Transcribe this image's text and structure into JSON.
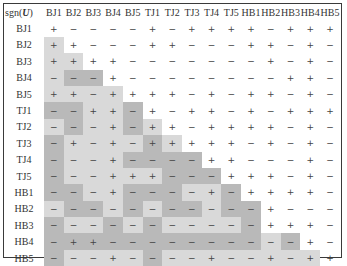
{
  "table": {
    "corner_label_prefix": "sgn(",
    "corner_label_var": "U",
    "corner_label_suffix": ")",
    "columns": [
      "BJ1",
      "BJ2",
      "BJ3",
      "BJ4",
      "BJ5",
      "TJ1",
      "TJ2",
      "TJ3",
      "TJ4",
      "TJ5",
      "HB1",
      "HB2",
      "HB3",
      "HB4",
      "HB5"
    ],
    "rows": [
      {
        "label": "BJ1",
        "cells": [
          "+",
          "−",
          "−",
          "−",
          "−",
          "+",
          "−",
          "+",
          "+",
          "+",
          "+",
          "−",
          "+",
          "+",
          "+"
        ]
      },
      {
        "label": "BJ2",
        "cells": [
          "+",
          "+",
          "−",
          "−",
          "−",
          "+",
          "+",
          "−",
          "−",
          "−",
          "+",
          "+",
          "−",
          "+",
          "−"
        ]
      },
      {
        "label": "BJ3",
        "cells": [
          "+",
          "+",
          "+",
          "+",
          "−",
          "−",
          "−",
          "−",
          "−",
          "−",
          "−",
          "+",
          "−",
          "+",
          "−"
        ]
      },
      {
        "label": "BJ4",
        "cells": [
          "−",
          "−",
          "−",
          "+",
          "−",
          "−",
          "−",
          "−",
          "−",
          "−",
          "−",
          "−",
          "+",
          "+",
          "−"
        ]
      },
      {
        "label": "BJ5",
        "cells": [
          "+",
          "+",
          "−",
          "+",
          "+",
          "+",
          "+",
          "−",
          "+",
          "−",
          "+",
          "+",
          "−",
          "+",
          "−"
        ]
      },
      {
        "label": "TJ1",
        "cells": [
          "−",
          "−",
          "+",
          "+",
          "−",
          "+",
          "−",
          "+",
          "+",
          "−",
          "+",
          "−",
          "+",
          "+",
          "+"
        ]
      },
      {
        "label": "TJ2",
        "cells": [
          "−",
          "−",
          "−",
          "+",
          "−",
          "+",
          "+",
          "−",
          "+",
          "+",
          "+",
          "+",
          "−",
          "+",
          "−"
        ]
      },
      {
        "label": "TJ3",
        "cells": [
          "−",
          "+",
          "−",
          "+",
          "−",
          "+",
          "+",
          "+",
          "+",
          "+",
          "−",
          "+",
          "−",
          "+",
          "−"
        ]
      },
      {
        "label": "TJ4",
        "cells": [
          "−",
          "−",
          "−",
          "+",
          "−",
          "−",
          "−",
          "−",
          "+",
          "+",
          "−",
          "−",
          "−",
          "+",
          "−"
        ]
      },
      {
        "label": "TJ5",
        "cells": [
          "−",
          "−",
          "−",
          "+",
          "+",
          "+",
          "−",
          "−",
          "−",
          "+",
          "+",
          "+",
          "−",
          "+",
          "−"
        ]
      },
      {
        "label": "HB1",
        "cells": [
          "−",
          "−",
          "−",
          "+",
          "−",
          "−",
          "−",
          "−",
          "+",
          "−",
          "+",
          "+",
          "+",
          "+",
          "−"
        ]
      },
      {
        "label": "HB2",
        "cells": [
          "−",
          "−",
          "−",
          "−",
          "−",
          "−",
          "−",
          "−",
          "−",
          "−",
          "−",
          "+",
          "−",
          "−",
          "−"
        ]
      },
      {
        "label": "HB3",
        "cells": [
          "−",
          "−",
          "−",
          "−",
          "−",
          "−",
          "−",
          "−",
          "−",
          "−",
          "−",
          "+",
          "+",
          "+",
          "−"
        ]
      },
      {
        "label": "HB4",
        "cells": [
          "−",
          "+",
          "+",
          "−",
          "−",
          "−",
          "−",
          "−",
          "−",
          "−",
          "−",
          "−",
          "−",
          "+",
          "−"
        ]
      },
      {
        "label": "HB5",
        "cells": [
          "−",
          "−",
          "−",
          "+",
          "−",
          "−",
          "−",
          "−",
          "+",
          "−",
          "−",
          "+",
          "−",
          "+",
          "+"
        ]
      }
    ],
    "shading": [
      [
        0,
        0,
        0,
        0,
        0,
        0,
        0,
        0,
        0,
        0,
        0,
        0,
        0,
        0,
        0
      ],
      [
        1,
        0,
        0,
        0,
        0,
        0,
        0,
        0,
        0,
        0,
        0,
        0,
        0,
        0,
        0
      ],
      [
        1,
        1,
        0,
        0,
        0,
        0,
        0,
        0,
        0,
        0,
        0,
        0,
        0,
        0,
        0
      ],
      [
        1,
        2,
        2,
        0,
        0,
        0,
        0,
        0,
        0,
        0,
        0,
        0,
        0,
        0,
        0
      ],
      [
        1,
        1,
        1,
        1,
        0,
        0,
        0,
        0,
        0,
        0,
        0,
        0,
        0,
        0,
        0
      ],
      [
        2,
        2,
        1,
        1,
        2,
        0,
        0,
        0,
        0,
        0,
        0,
        0,
        0,
        0,
        0
      ],
      [
        1,
        2,
        1,
        1,
        2,
        1,
        0,
        0,
        0,
        0,
        0,
        0,
        0,
        0,
        0
      ],
      [
        2,
        1,
        1,
        1,
        1,
        2,
        1,
        0,
        0,
        0,
        0,
        0,
        0,
        0,
        0
      ],
      [
        2,
        1,
        1,
        1,
        2,
        2,
        2,
        2,
        0,
        0,
        0,
        0,
        0,
        0,
        0
      ],
      [
        2,
        1,
        1,
        1,
        1,
        1,
        2,
        2,
        2,
        0,
        0,
        0,
        0,
        0,
        0
      ],
      [
        2,
        2,
        1,
        1,
        2,
        2,
        2,
        1,
        1,
        2,
        0,
        0,
        0,
        0,
        0
      ],
      [
        1,
        2,
        2,
        1,
        2,
        1,
        2,
        2,
        1,
        2,
        2,
        0,
        0,
        0,
        0
      ],
      [
        2,
        1,
        1,
        2,
        1,
        2,
        1,
        1,
        1,
        1,
        2,
        0,
        0,
        0,
        0
      ],
      [
        2,
        2,
        2,
        2,
        2,
        2,
        2,
        2,
        2,
        2,
        2,
        1,
        2,
        0,
        0
      ],
      [
        2,
        1,
        1,
        1,
        1,
        2,
        1,
        1,
        1,
        1,
        1,
        1,
        1,
        1,
        0
      ]
    ],
    "shade_colors": {
      "0": "#ffffff",
      "1": "#d9d9d9",
      "2": "#b9b9b9"
    }
  }
}
